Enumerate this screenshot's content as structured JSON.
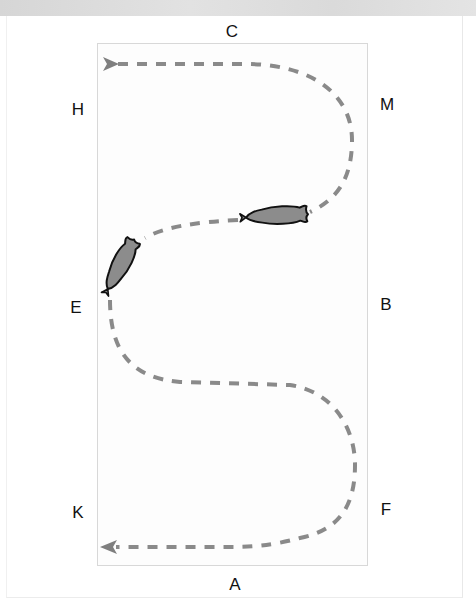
{
  "diagram": {
    "type": "dressage-arena-serpentine",
    "markers": {
      "top": "C",
      "bottom": "A",
      "left_upper": "H",
      "left_middle": "E",
      "left_lower": "K",
      "right_upper": "M",
      "right_middle": "B",
      "right_lower": "F"
    },
    "path": {
      "style": "dashed",
      "color": "#8a8a8a",
      "start_arrow_direction": "right",
      "end_arrow_direction": "left"
    },
    "horses": [
      {
        "label": "horse-1",
        "position": "left side near E",
        "color": "#8c8c8c"
      },
      {
        "label": "horse-2",
        "position": "center upper loop",
        "color": "#8c8c8c"
      }
    ],
    "colors": {
      "arena_border": "#d8d8d8",
      "path": "#8a8a8a",
      "horse_fill": "#8c8c8c",
      "horse_outline": "#111111",
      "top_band": "#dcdcdc"
    }
  }
}
